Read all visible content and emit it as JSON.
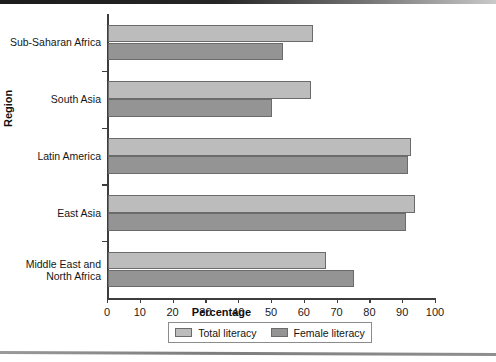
{
  "chart_data": {
    "type": "bar",
    "orientation": "horizontal",
    "title": "",
    "xlabel": "Percentage",
    "ylabel": "Region",
    "xlim": [
      0,
      100
    ],
    "xticks": [
      0,
      10,
      20,
      30,
      40,
      50,
      60,
      70,
      80,
      90,
      100
    ],
    "grid": false,
    "legend_position": "bottom-center",
    "categories": [
      "Sub-Saharan Africa",
      "South Asia",
      "Latin America",
      "East Asia",
      "Middle East and\nNorth Africa"
    ],
    "series": [
      {
        "name": "Total literacy",
        "color": "#bcbcbc",
        "values": [
          62.5,
          62.0,
          92.5,
          93.7,
          66.5
        ]
      },
      {
        "name": "Female literacy",
        "color": "#949494",
        "values": [
          53.5,
          50.0,
          91.5,
          91.0,
          75.0
        ]
      }
    ]
  },
  "legend": {
    "items": [
      {
        "label": "Total literacy"
      },
      {
        "label": "Female literacy"
      }
    ]
  }
}
